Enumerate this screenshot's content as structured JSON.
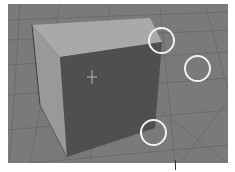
{
  "viewport": {
    "type": "3d-viewport",
    "background_color": "#7a7a7a",
    "grid_color": "#6a6a6a",
    "object": {
      "name": "cube",
      "top_face_color": "#a9a9a9",
      "left_face_color": "#9a9a9a",
      "front_face_color": "#4f4f4f"
    },
    "origin_marker": {
      "x": 92,
      "y": 77
    },
    "highlight_circles": [
      {
        "name": "circle-top-right-corner",
        "cx": 161,
        "cy": 40,
        "r": 13
      },
      {
        "name": "circle-empty-space",
        "cx": 197,
        "cy": 68,
        "r": 13
      },
      {
        "name": "circle-bottom-corner",
        "cx": 153,
        "cy": 132,
        "r": 13
      }
    ],
    "circle_color": "#f2f2f2"
  }
}
